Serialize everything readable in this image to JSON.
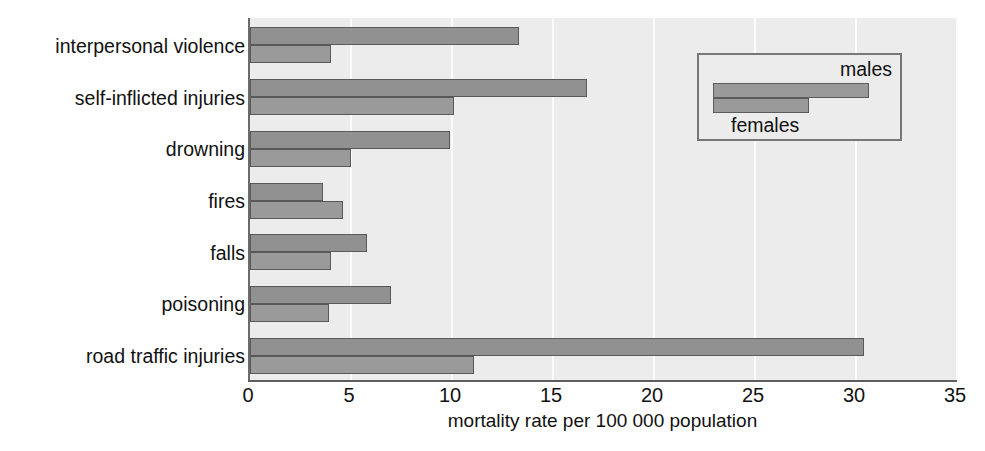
{
  "chart_data": {
    "type": "bar",
    "orientation": "horizontal",
    "title": "",
    "subtitle": "",
    "xlabel": "mortality rate per 100 000 population",
    "ylabel": "",
    "xlim": [
      0,
      35
    ],
    "xticks": [
      0,
      5,
      10,
      15,
      20,
      25,
      30,
      35
    ],
    "xtick_labels": [
      "0",
      "5",
      "10",
      "15",
      "20",
      "25",
      "30",
      "35"
    ],
    "grid": "vertical-faint",
    "legend_position": "top-right",
    "categories": [
      "interpersonal violence",
      "self-inflicted injuries",
      "drowning",
      "fires",
      "falls",
      "poisoning",
      "road traffic injuries"
    ],
    "series": [
      {
        "name": "males",
        "color": "#919191",
        "values": [
          13.3,
          16.7,
          9.9,
          3.6,
          5.8,
          7.0,
          30.4
        ]
      },
      {
        "name": "females",
        "color": "#9a9a9a",
        "values": [
          4.0,
          10.1,
          5.0,
          4.6,
          4.0,
          3.9,
          11.1
        ]
      }
    ],
    "legend_entries": [
      "males",
      "females"
    ]
  },
  "legend": {
    "males_label": "males",
    "females_label": "females"
  },
  "axis": {
    "x_title": "mortality rate per 100 000 population"
  },
  "colors": {
    "plot_background": "#ececec",
    "bar_male": "#919191",
    "bar_female": "#9a9a9a",
    "bar_border": "#595959",
    "axis_line": "#5e5e5e",
    "gridline": "#fbfbfb",
    "text": "#111111",
    "page_background": "#ffffff"
  }
}
